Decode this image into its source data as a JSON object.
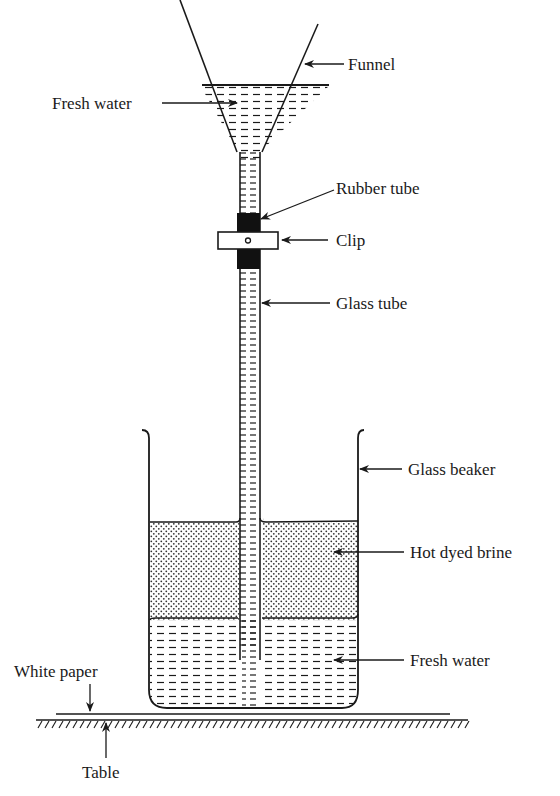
{
  "diagram": {
    "labels": {
      "funnel": "Funnel",
      "fresh_water_top": "Fresh water",
      "rubber_tube": "Rubber tube",
      "clip": "Clip",
      "glass_tube": "Glass tube",
      "glass_beaker": "Glass beaker",
      "hot_dyed_brine": "Hot dyed brine",
      "fresh_water_bottom": "Fresh water",
      "white_paper": "White paper",
      "table": "Table"
    },
    "colors": {
      "ink": "#1a1a1a",
      "background": "#ffffff"
    },
    "patterns": {
      "fresh_water": "dashes",
      "hot_dyed_brine": "dots",
      "table": "hatching"
    }
  }
}
